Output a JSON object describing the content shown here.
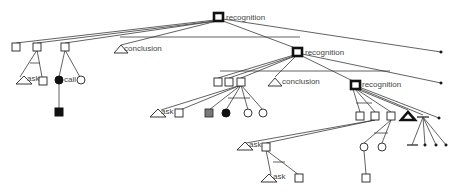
{
  "diagram": {
    "labels": {
      "root": "recognition",
      "l1_conclusion": "conclusion",
      "l1_ask": "ask",
      "l1_call": "call",
      "l2_recognition": "recognition",
      "l2_conclusion": "conclusion",
      "l2_ask": "ask",
      "l3_recognition": "recognition",
      "l3_ask": "ask",
      "l4_ask": "ask"
    },
    "colors": {
      "stroke": "#222222",
      "fill_dark": "#111111",
      "text": "#444444",
      "background": "#ffffff"
    },
    "node_types": [
      "bold-square",
      "square",
      "triangle",
      "bold-triangle",
      "circle",
      "filled-circle",
      "filled-square",
      "hatched-square",
      "dot",
      "t-bar"
    ]
  }
}
